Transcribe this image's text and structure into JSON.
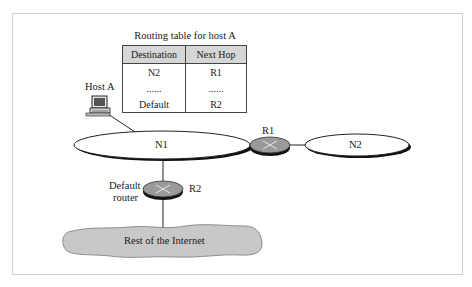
{
  "diagram": {
    "routing_table": {
      "title": "Routing table for host A",
      "headers": [
        "Destination",
        "Next Hop"
      ],
      "rows": [
        [
          "N2",
          "R1"
        ],
        [
          "......",
          "......"
        ],
        [
          "Default",
          "R2"
        ]
      ]
    },
    "nodes": {
      "host_a": "Host A",
      "n1": "N1",
      "n2": "N2",
      "r1": "R1",
      "r2": "R2",
      "default_router_line1": "Default",
      "default_router_line2": "router",
      "internet": "Rest of the Internet"
    },
    "edges": [
      {
        "from": "Host A",
        "to": "N1"
      },
      {
        "from": "N1",
        "to": "R1"
      },
      {
        "from": "R1",
        "to": "N2"
      },
      {
        "from": "N1",
        "to": "R2"
      },
      {
        "from": "R2",
        "to": "Rest of the Internet"
      }
    ],
    "colors": {
      "router_fill": "#9a9a9a",
      "cloud_fill": "#c8c8c8",
      "table_header_fill": "#d6d6d6",
      "frame_border": "#cfcfcf"
    }
  }
}
